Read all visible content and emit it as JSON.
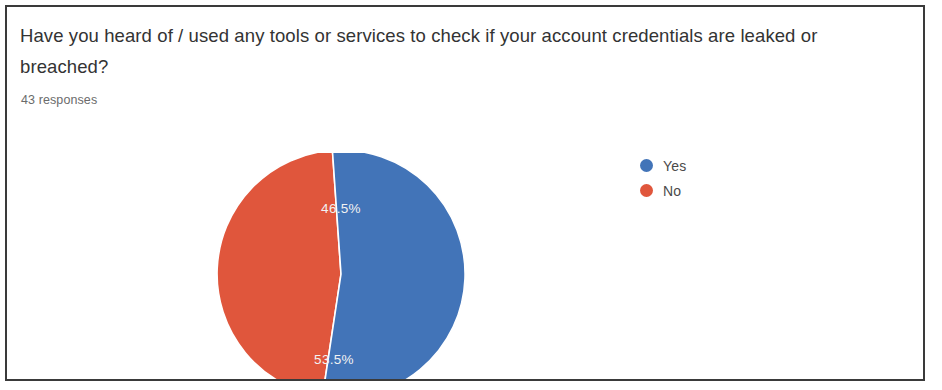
{
  "survey": {
    "question": "Have you heard of / used any tools or services to check if your account credentials are leaked or breached?",
    "response_count_label": "43 responses"
  },
  "legend": {
    "items": [
      {
        "label": "Yes",
        "color": "#4274b8"
      },
      {
        "label": "No",
        "color": "#e0563c"
      }
    ]
  },
  "colors": {
    "yes_blue": "#4274b8",
    "no_red": "#e0563c",
    "label_text": "#f2f2f2",
    "frame_border": "#3a3a3a",
    "title_text": "#333333",
    "meta_text": "#6b6b6b"
  },
  "slices": {
    "yes_pct_label": "53.5%",
    "no_pct_label": "46.5%"
  },
  "chart_data": {
    "type": "pie",
    "title": "Have you heard of / used any tools or services to check if your account credentials are leaked or breached?",
    "subtitle": "43 responses",
    "categories": [
      "Yes",
      "No"
    ],
    "values": [
      53.5,
      46.5
    ],
    "value_unit": "percent",
    "counts": [
      23,
      20
    ],
    "total_responses": 43,
    "data_labels": [
      "53.5%",
      "46.5%"
    ],
    "colors": [
      "#4274b8",
      "#e0563c"
    ],
    "legend": "right",
    "grid": false,
    "start_angle_deg": 0,
    "direction": "clockwise",
    "xlabel": "",
    "ylabel": ""
  }
}
